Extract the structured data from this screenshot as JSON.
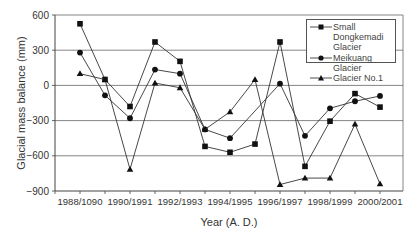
{
  "chart_data": {
    "type": "line",
    "title": "",
    "xlabel": "Year (A. D.)",
    "ylabel": "Glacial mass balance (mm)",
    "ylim": [
      -900,
      600
    ],
    "yticks": [
      600,
      300,
      0,
      -300,
      -600,
      -900
    ],
    "grid": "horizontal",
    "legend_position": "upper right",
    "x": [
      "1988/1989",
      "1989/1990",
      "1990/1991",
      "1991/1992",
      "1992/1993",
      "1993/1994",
      "1994/1995",
      "1995/1996",
      "1996/1997",
      "1997/1998",
      "1998/1999",
      "1999/2000",
      "2000/2001"
    ],
    "x_tick_labels": [
      "1988/1090",
      "1990/1991",
      "1992/1993",
      "1994/1995",
      "1996/1997",
      "1998/1999",
      "2000/2001"
    ],
    "series": [
      {
        "name": "Small Dongkemadi Glacier",
        "marker": "square",
        "values": [
          525,
          50,
          -180,
          370,
          205,
          -520,
          -570,
          -500,
          370,
          -690,
          -305,
          -70,
          -185
        ]
      },
      {
        "name": "Meikuang Glacier",
        "marker": "circle",
        "values": [
          280,
          -85,
          -280,
          135,
          100,
          -375,
          -450,
          null,
          15,
          -430,
          -195,
          -135,
          -90
        ]
      },
      {
        "name": "Glacier No.1",
        "marker": "triangle",
        "values": [
          100,
          50,
          -715,
          20,
          -20,
          -375,
          -225,
          50,
          -845,
          -790,
          -790,
          -330,
          -840
        ]
      }
    ]
  },
  "legend": {
    "items": [
      {
        "label": "Small Dongkemadi Glacier",
        "marker": "square"
      },
      {
        "label": "Meikuang Glacier",
        "marker": "circle"
      },
      {
        "label": "Glacier No.1",
        "marker": "triangle"
      }
    ]
  }
}
